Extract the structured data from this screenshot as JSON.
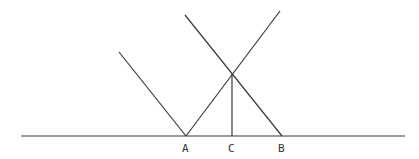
{
  "diagram": {
    "type": "geometry",
    "points": {
      "A": {
        "label": "A",
        "x": 186,
        "y": 136
      },
      "B": {
        "label": "B",
        "x": 282,
        "y": 136
      },
      "C": {
        "label": "C",
        "x": 232,
        "y": 136
      },
      "P": {
        "label": "",
        "x": 232,
        "y": 74
      }
    },
    "labels": [
      {
        "id": "A",
        "text": "A",
        "x": 182,
        "y": 152
      },
      {
        "id": "C",
        "text": "C",
        "x": 228,
        "y": 152
      },
      {
        "id": "B",
        "text": "B",
        "x": 278,
        "y": 152
      }
    ],
    "segments": [
      {
        "name": "baseline",
        "x1": 21,
        "y1": 136,
        "x2": 405,
        "y2": 136
      },
      {
        "name": "left-ray-to-A",
        "x1": 119,
        "y1": 52,
        "x2": 186,
        "y2": 136
      },
      {
        "name": "A-to-upper-right",
        "x1": 186,
        "y1": 136,
        "x2": 280,
        "y2": 11
      },
      {
        "name": "upper-left-to-B",
        "x1": 185,
        "y1": 15,
        "x2": 282,
        "y2": 136
      },
      {
        "name": "perpendicular-C",
        "x1": 232,
        "y1": 74,
        "x2": 232,
        "y2": 136
      }
    ],
    "colors": {
      "line": "#3a3a3a",
      "text": "#333333",
      "background": "#ffffff"
    }
  }
}
